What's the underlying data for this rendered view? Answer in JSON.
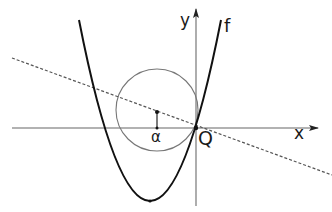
{
  "figure": {
    "labels": {
      "x_axis": "x",
      "y_axis": "y",
      "function": "f",
      "origin_point": "Q",
      "circle_center_marker": "α"
    },
    "elements": {
      "x_axis": {
        "from": [
          12,
          128
        ],
        "to": [
          318,
          128
        ],
        "arrow": true
      },
      "y_axis": {
        "from": [
          196,
          206
        ],
        "to": [
          196,
          8
        ],
        "arrow": true
      },
      "parabola": {
        "name": "f",
        "vertex": [
          150,
          201
        ],
        "passes_through": [
          196,
          128
        ],
        "style": "solid thick"
      },
      "circle": {
        "center": [
          157,
          110
        ],
        "radius": 41,
        "style": "solid thin gray"
      },
      "tangent_line": {
        "from": [
          12,
          58
        ],
        "to": [
          332,
          175
        ],
        "through": [
          196,
          128
        ],
        "style": "dashed"
      },
      "alpha_segment": {
        "from": [
          157,
          128
        ],
        "to": [
          157,
          112
        ]
      }
    },
    "colors": {
      "axis": "#555555",
      "curve": "#111111",
      "circle": "#777777",
      "dashed_line": "#555555",
      "text": "#1a1a1a"
    }
  }
}
